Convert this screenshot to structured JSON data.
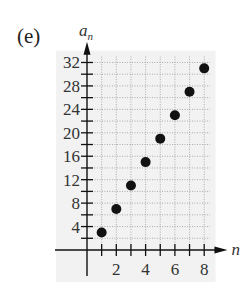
{
  "figure": {
    "label": "(e)"
  },
  "chart_data": {
    "type": "scatter",
    "title": "",
    "xlabel": "n",
    "ylabel": "a_n",
    "x": [
      1,
      2,
      3,
      4,
      5,
      6,
      7,
      8
    ],
    "y": [
      3,
      7,
      11,
      15,
      19,
      23,
      27,
      31
    ],
    "xticks": [
      2,
      4,
      6,
      8
    ],
    "yticks": [
      4,
      8,
      12,
      16,
      20,
      24,
      28,
      32
    ],
    "xlim": [
      0,
      8.5
    ],
    "ylim": [
      0,
      34
    ],
    "grid": true,
    "grid_style": "dotted",
    "minor_x_step": 1,
    "minor_y_step": 2,
    "marker_color": "#111111",
    "grid_bg": "#f2f2f2"
  }
}
